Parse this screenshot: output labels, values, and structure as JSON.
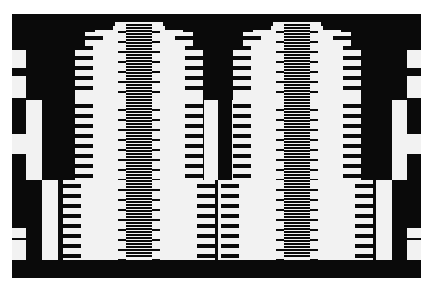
{
  "colors": {
    "black": "#0a0a0a",
    "white": "#f2f2f2",
    "background": "#ffffff",
    "stripe_gray": "#8a8a8a"
  },
  "frame": {
    "x": 12,
    "y": 14,
    "w": 409,
    "h": 264
  },
  "motif_centers": [
    139,
    297
  ],
  "stripe_column": {
    "half_width": 13,
    "y_top": 24,
    "y_bottom": 258,
    "period": 3
  },
  "tiers": [
    {
      "y": 22,
      "h": 78,
      "steps": [
        [
          0,
          4,
          24
        ],
        [
          4,
          6,
          44
        ],
        [
          10,
          14,
          54
        ],
        [
          24,
          56,
          64
        ]
      ]
    },
    {
      "y": 100,
      "h": 80,
      "steps": [
        [
          0,
          80,
          64
        ],
        [
          2,
          76,
          54
        ],
        [
          8,
          64,
          44
        ],
        [
          14,
          52,
          34
        ],
        [
          20,
          40,
          24
        ]
      ]
    },
    {
      "y": 180,
      "h": 80,
      "steps": [
        [
          0,
          80,
          76
        ],
        [
          2,
          76,
          64
        ],
        [
          8,
          64,
          54
        ],
        [
          14,
          52,
          44
        ],
        [
          20,
          40,
          34
        ],
        [
          26,
          28,
          24
        ]
      ]
    }
  ],
  "tongues": {
    "period": 10,
    "depth": 18,
    "thickness": 4
  },
  "side_columns": [
    {
      "x": 12,
      "w": 14,
      "blocks": [
        [
          36,
          18,
          "w"
        ],
        [
          62,
          22,
          "w"
        ],
        [
          100,
          12,
          "b"
        ],
        [
          120,
          20,
          "w"
        ],
        [
          180,
          20,
          "b"
        ],
        [
          214,
          10,
          "w"
        ],
        [
          226,
          34,
          "w"
        ]
      ]
    },
    {
      "x": 407,
      "w": 14,
      "blocks": [
        [
          36,
          18,
          "w"
        ],
        [
          62,
          22,
          "w"
        ],
        [
          100,
          12,
          "b"
        ],
        [
          120,
          20,
          "w"
        ],
        [
          180,
          20,
          "b"
        ],
        [
          214,
          10,
          "w"
        ],
        [
          226,
          34,
          "w"
        ]
      ]
    }
  ],
  "gutter_columns": [
    {
      "x": 26,
      "w": 16,
      "segments": [
        [
          100,
          80,
          "w"
        ],
        [
          180,
          80,
          "b"
        ]
      ]
    },
    {
      "x": 42,
      "w": 16,
      "segments": [
        [
          100,
          80,
          "b"
        ],
        [
          180,
          80,
          "w"
        ]
      ]
    },
    {
      "x": 204,
      "w": 14,
      "segments": [
        [
          100,
          80,
          "w"
        ],
        [
          180,
          80,
          "b"
        ]
      ]
    },
    {
      "x": 218,
      "w": 14,
      "segments": [
        [
          100,
          80,
          "b"
        ],
        [
          180,
          80,
          "w"
        ]
      ]
    },
    {
      "x": 232,
      "w": 14,
      "segments": [
        [
          100,
          80,
          "w"
        ],
        [
          180,
          80,
          "b"
        ]
      ]
    },
    {
      "x": 376,
      "w": 16,
      "segments": [
        [
          100,
          80,
          "b"
        ],
        [
          180,
          80,
          "w"
        ]
      ]
    },
    {
      "x": 392,
      "w": 15,
      "segments": [
        [
          100,
          80,
          "w"
        ],
        [
          180,
          80,
          "b"
        ]
      ]
    }
  ],
  "bottom_band": {
    "y": 260,
    "h": 18
  }
}
